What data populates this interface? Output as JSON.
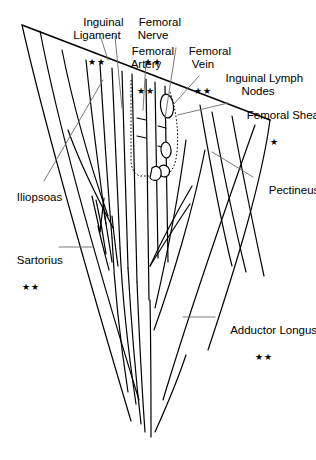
{
  "figure": {
    "background_color": "#ffffff",
    "stroke_color": "#000000",
    "leader_color": "#6b6b6b",
    "width": 316,
    "height": 460
  },
  "labels": {
    "inguinal_ligament": {
      "text": "Inguinal\nLigament",
      "marker": "★★"
    },
    "femoral_nerve": {
      "text": "Femoral\nNerve",
      "marker": "★★"
    },
    "femoral_artery": {
      "text": "Femoral\nArtery",
      "marker": "★★"
    },
    "femoral_vein": {
      "text": "Femoral\nVein",
      "marker": "★★"
    },
    "inguinal_lymph_nodes": {
      "text": "Inguinal Lymph\nNodes",
      "marker": ""
    },
    "femoral_sheath": {
      "text": "Femoral Sheath",
      "marker": "★"
    },
    "iliopsoas": {
      "text": "Iliopsoas",
      "marker": ""
    },
    "pectineus": {
      "text": "Pectineus",
      "marker": ""
    },
    "sartorius": {
      "text": "Sartorius",
      "marker": "★★"
    },
    "adductor_longus": {
      "text": "Adductor Longus",
      "marker": "★★"
    }
  }
}
